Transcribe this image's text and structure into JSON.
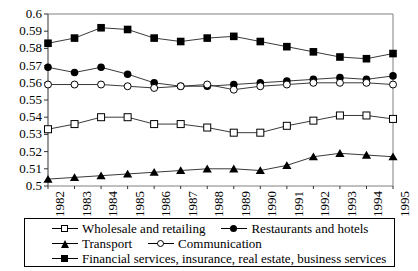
{
  "chart_data": {
    "type": "line",
    "title": "",
    "subtitle": "",
    "xlabel": "",
    "ylabel": "",
    "x": [
      1982,
      1983,
      1984,
      1985,
      1986,
      1987,
      1988,
      1989,
      1990,
      1991,
      1992,
      1993,
      1994,
      1995
    ],
    "xtick_labels": [
      "1982",
      "1983",
      "1984",
      "1985",
      "1986",
      "1987",
      "1988",
      "1989",
      "1990",
      "1991",
      "1992",
      "1993",
      "1994",
      "1995"
    ],
    "ytick_labels": [
      "0.6",
      "0.59",
      "0.58",
      "0.57",
      "0.56",
      "0.55",
      "0.54",
      "0.53",
      "0.52",
      "0.51",
      "0.5"
    ],
    "ylim": [
      0.5,
      0.6
    ],
    "xlim": [
      1982,
      1995
    ],
    "ytick_values": [
      0.6,
      0.59,
      0.58,
      0.57,
      0.56,
      0.55,
      0.54,
      0.53,
      0.52,
      0.51,
      0.5
    ],
    "grid": false,
    "legend_position": "below-plot",
    "series": [
      {
        "name": "Wholesale and retailing",
        "marker": "open-square",
        "color": "#000000",
        "values": [
          0.533,
          0.536,
          0.54,
          0.54,
          0.536,
          0.536,
          0.534,
          0.531,
          0.531,
          0.535,
          0.538,
          0.541,
          0.541,
          0.539
        ]
      },
      {
        "name": "Restaurants and hotels",
        "marker": "filled-circle",
        "color": "#000000",
        "values": [
          0.569,
          0.566,
          0.569,
          0.565,
          0.56,
          0.558,
          0.558,
          0.559,
          0.56,
          0.561,
          0.562,
          0.563,
          0.562,
          0.564
        ]
      },
      {
        "name": "Transport",
        "marker": "filled-triangle",
        "color": "#000000",
        "values": [
          0.504,
          0.505,
          0.506,
          0.507,
          0.508,
          0.509,
          0.51,
          0.51,
          0.509,
          0.512,
          0.517,
          0.519,
          0.518,
          0.517
        ]
      },
      {
        "name": "Communication",
        "marker": "open-circle",
        "color": "#000000",
        "values": [
          0.559,
          0.559,
          0.559,
          0.558,
          0.557,
          0.558,
          0.559,
          0.556,
          0.558,
          0.559,
          0.56,
          0.56,
          0.56,
          0.559
        ]
      },
      {
        "name": "Financial services, insurance, real estate, business services",
        "marker": "filled-square",
        "color": "#000000",
        "values": [
          0.583,
          0.586,
          0.592,
          0.591,
          0.586,
          0.584,
          0.586,
          0.587,
          0.584,
          0.581,
          0.578,
          0.575,
          0.574,
          0.577
        ]
      }
    ]
  },
  "legend": {
    "rows": [
      [
        {
          "label": "Wholesale and retailing",
          "marker": "open-square"
        },
        {
          "label": "Restaurants and hotels",
          "marker": "filled-circle"
        }
      ],
      [
        {
          "label": "Transport",
          "marker": "filled-triangle"
        },
        {
          "label": "Communication",
          "marker": "open-circle"
        }
      ],
      [
        {
          "label": "Financial services, insurance, real estate, business services",
          "marker": "filled-square"
        }
      ]
    ]
  }
}
